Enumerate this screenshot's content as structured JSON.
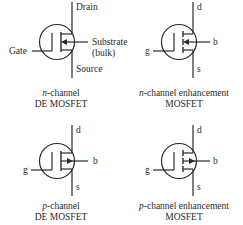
{
  "diagram": {
    "symbols": [
      {
        "id": "n-channel-de",
        "caption_line1_italic": "n",
        "caption_line1_rest": "-channel",
        "caption_line2": "DE MOSFET",
        "terminals": {
          "drain": "Drain",
          "gate": "Gate",
          "substrate": "Substrate",
          "substrate_sub": "(bulk)",
          "source": "Source"
        },
        "channel": "continuous",
        "arrow_direction": "inward"
      },
      {
        "id": "n-channel-enhancement",
        "caption_line1_italic": "n",
        "caption_line1_rest": "-channel enhancement",
        "caption_line2": "MOSFET",
        "terminals": {
          "drain": "d",
          "gate": "g",
          "substrate": "b",
          "source": "s"
        },
        "channel": "segmented",
        "arrow_direction": "inward"
      },
      {
        "id": "p-channel-de",
        "caption_line1_italic": "p",
        "caption_line1_rest": "-channel",
        "caption_line2": "DE MOSFET",
        "terminals": {
          "drain": "d",
          "gate": "g",
          "substrate": "b",
          "source": "s"
        },
        "channel": "continuous",
        "arrow_direction": "outward"
      },
      {
        "id": "p-channel-enhancement",
        "caption_line1_italic": "p",
        "caption_line1_rest": "-channel enhancement",
        "caption_line2": "MOSFET",
        "terminals": {
          "drain": "d",
          "gate": "g",
          "substrate": "b",
          "source": "s"
        },
        "channel": "segmented",
        "arrow_direction": "outward"
      }
    ],
    "colors": {
      "ink": "#2a2a2a",
      "background": "#ffffff"
    }
  }
}
